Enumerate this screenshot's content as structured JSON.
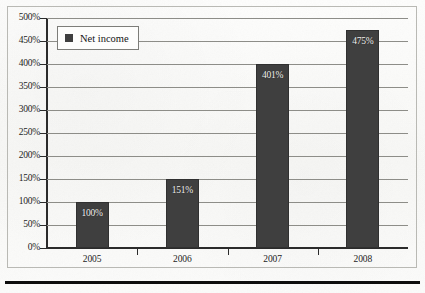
{
  "chart_data": {
    "type": "bar",
    "title": "",
    "xlabel": "",
    "ylabel": "",
    "categories": [
      "2005",
      "2006",
      "2007",
      "2008"
    ],
    "values": [
      100,
      151,
      401,
      475
    ],
    "value_labels": [
      "100%",
      "151%",
      "401%",
      "475%"
    ],
    "ylim": [
      0,
      500
    ],
    "ytick_step": 50,
    "ytick_labels": [
      "0%",
      "50%",
      "100%",
      "150%",
      "200%",
      "250%",
      "300%",
      "350%",
      "400%",
      "450%",
      "500%"
    ],
    "grid": true,
    "legend": {
      "position": "top-left",
      "entries": [
        {
          "label": "Net income",
          "color": "#3f3f3f",
          "marker": "square"
        }
      ]
    },
    "series": [
      {
        "name": "Net income",
        "values": [
          100,
          151,
          401,
          475
        ]
      }
    ]
  },
  "colors": {
    "bar": "#3f3f3f",
    "gridline": "#8d8d88",
    "axis": "#2b2b2b",
    "value_label": "#f2f2f0",
    "page": "#fbfbfa",
    "rule": "#0d0d0d"
  }
}
